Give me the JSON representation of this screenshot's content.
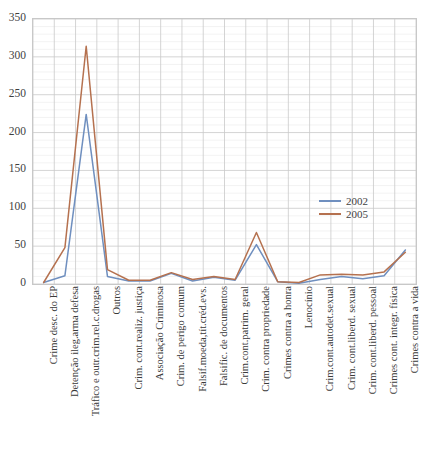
{
  "chart_data": {
    "type": "line",
    "title": "",
    "xlabel": "",
    "ylabel": "",
    "ylim": [
      0,
      350
    ],
    "ytick_step": 50,
    "yticks": [
      0,
      50,
      100,
      150,
      200,
      250,
      300,
      350
    ],
    "grid": true,
    "legend_position": "inside-right",
    "categories": [
      "Crime desc. do EP",
      "Detenção ileg.arma defesa",
      "Tráfico e outr.crim.rel.c.drogas",
      "Outros",
      "Crim. cont.realiz. justiça",
      "Associação Criminosa",
      "Crim. de perigo comum",
      "Falsif.moeda,tít.créd.evs.",
      "Falsific. de documentos",
      "Crim.cont.patrim. geral",
      "Crim. contra propriedade",
      "Crimes contra a honra",
      "Lenocínio",
      "Crim.cont.autodet.sexual",
      "Crim. cont.liberd. sexual",
      "Crim. cont.liberd. pessoal",
      "Crimes cont. integr. física",
      "Crimes contra a vida"
    ],
    "series": [
      {
        "name": "2002",
        "color": "#6f8fbf",
        "values": [
          2,
          11,
          224,
          10,
          4,
          4,
          14,
          4,
          9,
          5,
          52,
          3,
          1,
          6,
          10,
          7,
          11,
          45
        ]
      },
      {
        "name": "2005",
        "color": "#b5714f",
        "values": [
          2,
          48,
          314,
          19,
          5,
          5,
          15,
          6,
          10,
          6,
          68,
          3,
          2,
          12,
          13,
          12,
          16,
          42
        ]
      }
    ]
  },
  "legend": {
    "entries": [
      {
        "label": "2002",
        "color": "#6f8fbf"
      },
      {
        "label": "2005",
        "color": "#b5714f"
      }
    ]
  },
  "axis": {
    "y_tick_labels": [
      "350",
      "300",
      "250",
      "200",
      "150",
      "100",
      "50",
      "0"
    ]
  },
  "title_sliver": ""
}
